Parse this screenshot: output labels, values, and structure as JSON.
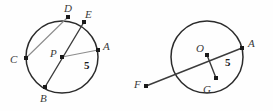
{
  "figure": {
    "background_color": "#fefefe",
    "circle_stroke_color": "#2b2b2b",
    "chord_light_color": "#8c8c8c",
    "chord_dark_color": "#3c3c3c",
    "point_color": "#1a1a1a",
    "label_color": "#3a3a3a",
    "measure_color": "#1a1a1a",
    "circles": [
      {
        "name": "circle-p",
        "center_label": "P",
        "cx": 62,
        "cy": 57,
        "r": 36
      },
      {
        "name": "circle-o",
        "center_label": "O",
        "cx": 207,
        "cy": 57,
        "r": 36
      }
    ],
    "points": [
      {
        "id": "D",
        "label": "D",
        "x": 68,
        "y": 17,
        "label_x": 64,
        "label_y": 3,
        "circle": "circle-p"
      },
      {
        "id": "E",
        "label": "E",
        "x": 84,
        "y": 22,
        "label_x": 85,
        "label_y": 9,
        "circle": "circle-p"
      },
      {
        "id": "C",
        "label": "C",
        "x": 26,
        "y": 58,
        "label_x": 10,
        "label_y": 54,
        "circle": "circle-p"
      },
      {
        "id": "A_left",
        "label": "A",
        "x": 98,
        "y": 50,
        "label_x": 103,
        "label_y": 41,
        "circle": "circle-p"
      },
      {
        "id": "P",
        "label": "P",
        "x": 62,
        "y": 57,
        "label_x": 50,
        "label_y": 48,
        "circle": "circle-p"
      },
      {
        "id": "B",
        "label": "B",
        "x": 45,
        "y": 87,
        "label_x": 40,
        "label_y": 93,
        "circle": "circle-p"
      },
      {
        "id": "O",
        "label": "O",
        "x": 207,
        "y": 55,
        "label_x": 196,
        "label_y": 43,
        "circle": "circle-o"
      },
      {
        "id": "A_right",
        "label": "A",
        "x": 242,
        "y": 48,
        "label_x": 248,
        "label_y": 38,
        "circle": "circle-o"
      },
      {
        "id": "G",
        "label": "G",
        "x": 216,
        "y": 78,
        "label_x": 203,
        "label_y": 84,
        "circle": "circle-o"
      },
      {
        "id": "F",
        "label": "F",
        "x": 146,
        "y": 86,
        "label_x": 134,
        "label_y": 79,
        "circle": "circle-o"
      }
    ],
    "segments": [
      {
        "id": "chord-CD",
        "from": "C",
        "to": "D",
        "style": "light"
      },
      {
        "id": "chord-BE",
        "from": "B",
        "to": "E",
        "style": "dark"
      },
      {
        "id": "radius-PA",
        "from": "P",
        "to": "A_left",
        "style": "light",
        "measure": "5"
      },
      {
        "id": "chord-FA",
        "from": "F",
        "to": "A_right",
        "style": "dark"
      },
      {
        "id": "segment-OG",
        "from": "O",
        "to": "G",
        "style": "dark"
      }
    ],
    "measures": [
      {
        "id": "measure-left",
        "text": "5",
        "x": 84,
        "y": 60
      },
      {
        "id": "measure-right",
        "text": "5",
        "x": 225,
        "y": 57
      }
    ]
  }
}
